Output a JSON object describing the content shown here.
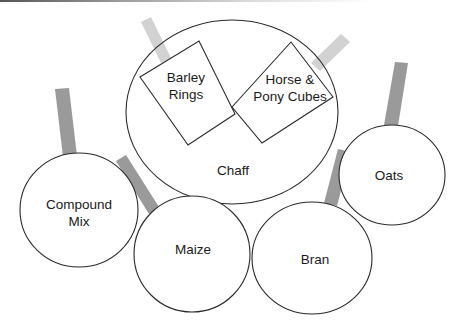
{
  "diagram": {
    "colors": {
      "outline": "#2a2a2a",
      "dark_tab": "#9a9a9a",
      "light_tab": "#d2d2d2",
      "fill": "#ffffff"
    },
    "nodes": [
      {
        "id": "chaff",
        "shape": "ellipse",
        "lines": [
          "Chaff"
        ]
      },
      {
        "id": "barley-rings",
        "shape": "rotated-rect",
        "lines": [
          "Barley",
          "Rings"
        ],
        "parent": "chaff"
      },
      {
        "id": "horse-pony-cubes",
        "shape": "rotated-rect",
        "lines": [
          "Horse &",
          "Pony Cubes"
        ],
        "parent": "chaff"
      },
      {
        "id": "compound-mix",
        "shape": "circle",
        "lines": [
          "Compound",
          "Mix"
        ]
      },
      {
        "id": "maize",
        "shape": "circle",
        "lines": [
          "Maize"
        ]
      },
      {
        "id": "bran",
        "shape": "circle",
        "lines": [
          "Bran"
        ]
      },
      {
        "id": "oats",
        "shape": "circle",
        "lines": [
          "Oats"
        ]
      }
    ]
  }
}
